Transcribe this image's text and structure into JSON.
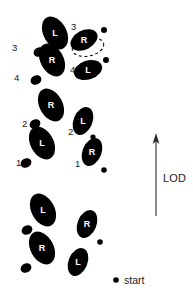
{
  "figure": {
    "type": "footprint-trail-diagram",
    "background_color": "#ffffff",
    "ink_color": "#000000",
    "width": 193,
    "height": 301
  },
  "direction_indicator": {
    "label": "LOD",
    "arrow_direction": "up",
    "arrow_tip_y": 134,
    "arrow_tail_y": 216,
    "arrow_x": 156
  },
  "start_marker": {
    "label": "start",
    "dot_x": 116,
    "dot_y": 280
  },
  "footprints": [
    {
      "id": "fp-start-left",
      "foot": "L",
      "letter": "L",
      "group": "start",
      "cx": 43,
      "cy": 210,
      "rx": 11.5,
      "ry": 17.5,
      "rotate": -28,
      "heel_cx": 27,
      "heel_cy": 230,
      "heel_rx": 5.6,
      "heel_ry": 4.6,
      "heel_rotate": -28,
      "label": "",
      "label_x": 0,
      "label_y": 0
    },
    {
      "id": "fp-start-right-col-r",
      "foot": "R",
      "letter": "R",
      "group": "start",
      "cx": 87,
      "cy": 224,
      "rx": 9.5,
      "ry": 14.5,
      "rotate": 22,
      "heel_cx": 97,
      "heel_cy": 240,
      "heel_rx": 4.8,
      "heel_ry": 4.0,
      "heel_rotate": 22,
      "label": "",
      "label_x": 0,
      "label_y": 0
    },
    {
      "id": "fp-start-left-lower-r",
      "foot": "R",
      "letter": "R",
      "group": "start",
      "cx": 42,
      "cy": 248,
      "rx": 11.5,
      "ry": 17.5,
      "rotate": -28,
      "heel_cx": 26,
      "heel_cy": 268,
      "heel_rx": 5.6,
      "heel_ry": 4.6,
      "heel_rotate": -28,
      "label": "",
      "label_x": 0,
      "label_y": 0
    },
    {
      "id": "fp-start-right-col-l",
      "foot": "L",
      "letter": "L",
      "group": "start",
      "cx": 78,
      "cy": 262,
      "rx": 9.5,
      "ry": 14.5,
      "rotate": 22,
      "heel_cx": 88,
      "heel_cy": 278,
      "heel_rx": 4.6,
      "heel_ry": 3.8,
      "heel_rotate": 22,
      "label": "",
      "label_x": 0,
      "label_y": 0
    },
    {
      "id": "fp-left-1",
      "foot": "L",
      "letter": "L",
      "group": "left-track",
      "cx": 42,
      "cy": 143,
      "rx": 11.5,
      "ry": 17.5,
      "rotate": -28,
      "heel_cx": 26,
      "heel_cy": 163,
      "heel_rx": 5.6,
      "heel_ry": 4.6,
      "heel_rotate": -28,
      "label": "1",
      "label_x": 16,
      "label_y": 166
    },
    {
      "id": "fp-left-2",
      "foot": "R",
      "letter": "R",
      "group": "left-track",
      "cx": 51,
      "cy": 105,
      "rx": 11.5,
      "ry": 17.5,
      "rotate": -28,
      "heel_cx": 35,
      "heel_cy": 124,
      "heel_rx": 5.6,
      "heel_ry": 4.6,
      "heel_rotate": -28,
      "label": "2",
      "label_x": 22,
      "label_y": 127
    },
    {
      "id": "fp-left-3",
      "foot": "L",
      "letter": "L",
      "group": "left-track",
      "cx": 55,
      "cy": 33,
      "rx": 11.5,
      "ry": 17.5,
      "rotate": -28,
      "heel_cx": 39,
      "heel_cy": 52,
      "heel_rx": 5.6,
      "heel_ry": 4.6,
      "heel_rotate": -28,
      "label": "3",
      "label_x": 12,
      "label_y": 51
    },
    {
      "id": "fp-left-4",
      "foot": "R",
      "letter": "R",
      "group": "left-track",
      "cx": 52,
      "cy": 60,
      "rx": 11.5,
      "ry": 17.5,
      "rotate": -28,
      "heel_cx": 36,
      "heel_cy": 80,
      "heel_rx": 5.6,
      "heel_ry": 4.6,
      "heel_rotate": -28,
      "label": "4",
      "label_x": 14,
      "label_y": 81
    },
    {
      "id": "fp-right-1",
      "foot": "R",
      "letter": "R",
      "group": "right-track",
      "cx": 92,
      "cy": 152,
      "rx": 9.5,
      "ry": 14.5,
      "rotate": 22,
      "heel_cx": 102,
      "heel_cy": 168,
      "heel_rx": 4.8,
      "heel_ry": 4.0,
      "heel_rotate": 22,
      "label": "1",
      "label_x": 75,
      "label_y": 167
    },
    {
      "id": "fp-right-2",
      "foot": "L",
      "letter": "L",
      "group": "right-track",
      "cx": 83,
      "cy": 121,
      "rx": 9.5,
      "ry": 14.5,
      "rotate": 22,
      "heel_cx": 93,
      "heel_cy": 137,
      "heel_rx": 4.6,
      "heel_ry": 3.8,
      "heel_rotate": 22,
      "label": "2",
      "label_x": 68,
      "label_y": 135
    },
    {
      "id": "fp-right-3",
      "foot": "R",
      "letter": "R",
      "group": "right-track",
      "cx": 84,
      "cy": 40,
      "rx": 9.5,
      "ry": 14.5,
      "rotate": 22,
      "heel_cx": 104,
      "heel_cy": 30,
      "heel_rx": 4.6,
      "heel_ry": 4.2,
      "heel_rotate": 22,
      "label": "3",
      "label_x": 71,
      "label_y": 30
    },
    {
      "id": "fp-right-4",
      "foot": "L",
      "letter": "L",
      "group": "right-track",
      "cx": 88,
      "cy": 70,
      "rx": 9.5,
      "ry": 14.5,
      "rotate": 72,
      "heel_cx": 106,
      "heel_cy": 60,
      "heel_rx": 4.6,
      "heel_ry": 3.8,
      "heel_rotate": 22,
      "label": "4",
      "label_x": 70,
      "label_y": 73
    }
  ],
  "dashed_ellipse": {
    "cx": 88,
    "cy": 47,
    "rx": 16,
    "ry": 9,
    "rotate": -12
  },
  "stray_dots": [
    {
      "id": "dot-3-upper",
      "cx": 104,
      "cy": 30,
      "r": 3.0
    },
    {
      "id": "dot-4-mid",
      "cx": 106,
      "cy": 60,
      "r": 3.0
    },
    {
      "id": "dot-1-right",
      "cx": 102,
      "cy": 168,
      "r": 2.8
    },
    {
      "id": "dot-2-right",
      "cx": 93,
      "cy": 137,
      "r": 2.6
    },
    {
      "id": "dot-start-col",
      "cx": 100,
      "cy": 242,
      "r": 2.8
    }
  ]
}
